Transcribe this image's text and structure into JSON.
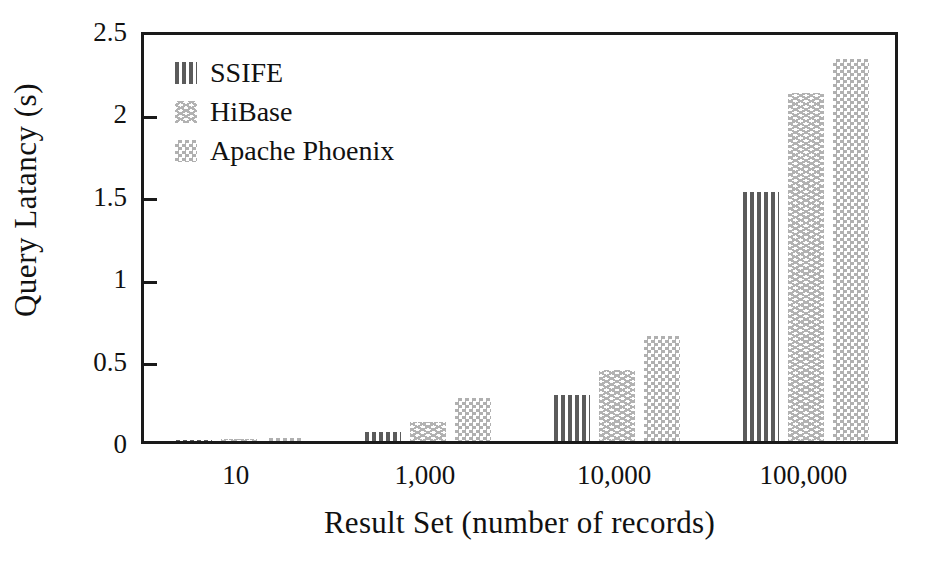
{
  "chart_data": {
    "type": "bar",
    "title": "",
    "xlabel": "Result Set (number of records)",
    "ylabel": "Query Latancy (s)",
    "categories": [
      "10",
      "1,000",
      "10,000",
      "100,000"
    ],
    "series": [
      {
        "name": "SSIFE",
        "values": [
          0.005,
          0.055,
          0.28,
          1.51
        ],
        "pattern": "vertical-stripes",
        "color": "#5b5b5b"
      },
      {
        "name": "HiBase",
        "values": [
          0.012,
          0.115,
          0.43,
          2.11
        ],
        "pattern": "wavy-lines",
        "color": "#b2b2b2"
      },
      {
        "name": "Apache Phoenix",
        "values": [
          0.02,
          0.26,
          0.64,
          2.32
        ],
        "pattern": "checkerboard",
        "color": "#b0b0b0"
      }
    ],
    "ylim": [
      0,
      2.5
    ],
    "ytick_labels": [
      "0",
      "0.5",
      "1",
      "1.5",
      "2",
      "2.5"
    ],
    "ytick_values": [
      0,
      0.5,
      1,
      1.5,
      2,
      2.5
    ],
    "grid": false,
    "legend_position": "top-left",
    "frame": true
  },
  "legend": {
    "entries": [
      {
        "label": "SSIFE",
        "swatch": "vertical-stripes-swatch"
      },
      {
        "label": "HiBase",
        "swatch": "wavy-lines-swatch"
      },
      {
        "label": "Apache Phoenix",
        "swatch": "checkerboard-swatch"
      }
    ]
  },
  "axes": {
    "y_title": "Query Latancy (s)",
    "x_title": "Result Set (number of records)"
  },
  "colors": {
    "frame": "#1a1a1a",
    "background": "#ffffff",
    "text": "#111111",
    "ssife": "#5b5b5b",
    "hibase": "#b2b2b2",
    "phoenix": "#b0b0b0"
  }
}
